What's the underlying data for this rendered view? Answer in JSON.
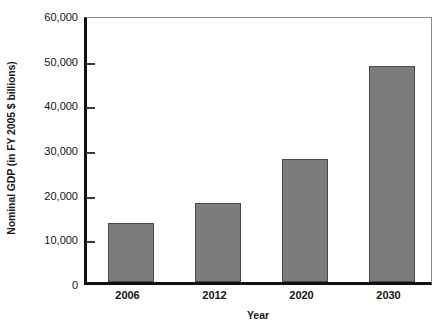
{
  "chart_data": {
    "type": "bar",
    "title": "",
    "categories": [
      "2006",
      "2012",
      "2020",
      "2030"
    ],
    "values": [
      13200,
      17700,
      27600,
      48400
    ],
    "series": [
      {
        "name": "Nominal GDP",
        "values": [
          13200,
          17700,
          27600,
          48400
        ]
      }
    ],
    "xlabel": "Year",
    "ylabel": "Nominal GDP (in FY 2005 $ billions)",
    "ylim": [
      0,
      60000
    ],
    "xlim_categories": 4,
    "y_ticks": [
      0,
      10000,
      20000,
      30000,
      40000,
      50000,
      60000
    ],
    "y_tick_labels": [
      "0",
      "10,000",
      "20,000",
      "30,000",
      "40,000",
      "50,000",
      "60,000"
    ],
    "x_tick_labels": [
      "2006",
      "2012",
      "2020",
      "2030"
    ],
    "grid": false,
    "legend": null,
    "legend_position": "none",
    "annotations": [],
    "bar_color": "#7c7c7c",
    "bar_border_color": "#4a4a4a",
    "axis_color": "#111111",
    "frame_color": "#8a8a8a",
    "text_color": "#141414",
    "background_color": "#ffffff"
  }
}
